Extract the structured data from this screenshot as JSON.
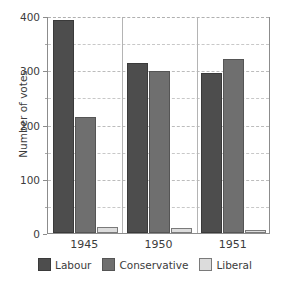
{
  "chart_data": {
    "type": "bar",
    "title": "",
    "xlabel": "",
    "ylabel": "Number of votes",
    "categories": [
      "1945",
      "1950",
      "1951"
    ],
    "series": [
      {
        "name": "Labour",
        "color": "#4d4d4d",
        "values": [
          393,
          313,
          295
        ]
      },
      {
        "name": "Conservative",
        "color": "#6f6f6f",
        "values": [
          213,
          298,
          321
        ]
      },
      {
        "name": "Liberal",
        "color": "#dcdcdc",
        "values": [
          12,
          9,
          6
        ]
      }
    ],
    "ylim": [
      0,
      400
    ],
    "yticks": [
      0,
      100,
      200,
      300,
      400
    ],
    "ytick_labels": [
      "0",
      "100",
      "200",
      "300",
      "400"
    ],
    "yminor_step": 50,
    "grid": true,
    "grid_axis": "y",
    "legend_position": "bottom"
  },
  "axes": {
    "y_title": "Number of votes"
  },
  "legend": {
    "items": [
      {
        "label": "Labour"
      },
      {
        "label": "Conservative"
      },
      {
        "label": "Liberal"
      }
    ]
  }
}
